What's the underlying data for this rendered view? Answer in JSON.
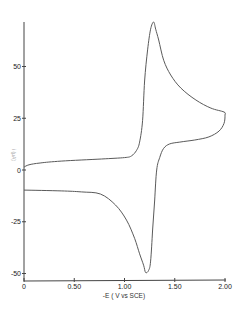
{
  "chart_data": {
    "type": "line",
    "title": "",
    "xlabel": "-E  ( V vs SCE)",
    "ylabel": "i (μA)",
    "xlim": [
      0,
      2.0
    ],
    "ylim": [
      -50,
      72
    ],
    "grid": false,
    "legend": null,
    "x_ticks": [
      0,
      0.5,
      1.0,
      1.5,
      2.0
    ],
    "x_tick_labels": [
      "0",
      "0.50",
      "1.00",
      "1.50",
      "2.00"
    ],
    "y_ticks": [
      50,
      25,
      0,
      -25,
      -50
    ],
    "y_tick_labels": [
      "50",
      "25",
      "0",
      "-25",
      "-50"
    ],
    "series": [
      {
        "name": "cyclic voltammogram",
        "points": [
          [
            0.0,
            1.4
          ],
          [
            0.05,
            2.5
          ],
          [
            0.16,
            3.4
          ],
          [
            0.37,
            4.3
          ],
          [
            0.77,
            5.3
          ],
          [
            1.0,
            6.0
          ],
          [
            1.07,
            6.8
          ],
          [
            1.12,
            9.5
          ],
          [
            1.15,
            13.5
          ],
          [
            1.18,
            24
          ],
          [
            1.2,
            43
          ],
          [
            1.23,
            58
          ],
          [
            1.26,
            68
          ],
          [
            1.29,
            71.5
          ],
          [
            1.31,
            68
          ],
          [
            1.34,
            62.8
          ],
          [
            1.39,
            53
          ],
          [
            1.46,
            45.9
          ],
          [
            1.56,
            39.6
          ],
          [
            1.71,
            33.8
          ],
          [
            1.86,
            29.9
          ],
          [
            1.99,
            28.0
          ],
          [
            2.0,
            26.5
          ],
          [
            1.99,
            22.5
          ],
          [
            1.94,
            18.8
          ],
          [
            1.84,
            16.0
          ],
          [
            1.7,
            14.5
          ],
          [
            1.55,
            13.5
          ],
          [
            1.45,
            12.6
          ],
          [
            1.39,
            10.5
          ],
          [
            1.35,
            6.0
          ],
          [
            1.32,
            0
          ],
          [
            1.3,
            -14.5
          ],
          [
            1.28,
            -29
          ],
          [
            1.26,
            -44
          ],
          [
            1.24,
            -48.5
          ],
          [
            1.21,
            -49.5
          ],
          [
            1.19,
            -46
          ],
          [
            1.15,
            -40.5
          ],
          [
            1.1,
            -33
          ],
          [
            1.02,
            -24.2
          ],
          [
            0.91,
            -16.9
          ],
          [
            0.76,
            -11.6
          ],
          [
            0.57,
            -10.6
          ],
          [
            0.37,
            -10.1
          ],
          [
            0.0,
            -9.7
          ]
        ]
      }
    ],
    "annotations": {
      "anodic_peak": {
        "E": 1.29,
        "i": 71.5
      },
      "cathodic_peak": {
        "E": 1.21,
        "i": -49.5
      }
    }
  }
}
